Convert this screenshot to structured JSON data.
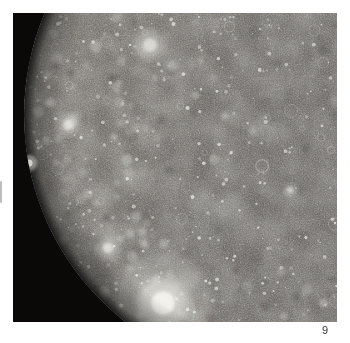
{
  "page": {
    "background": "#ffffff",
    "number": "9"
  },
  "photo": {
    "description": "Voyager photograph of Jupiter's moon Callisto: a heavily cratered gray-brown disk densely speckled with bright impact craters, its limb curving against black space on the left, with a large bright ray crater near the bottom center",
    "space_color": "#0a0908",
    "palette": {
      "surface_left": "#827e78",
      "surface_mid": "#787571",
      "surface_right": "#6e6b67",
      "crater_bright": "#f3f2ec",
      "shadow_dark": "#2e2c29",
      "limb_shadow": "#060605"
    },
    "disk": {
      "cx": 273,
      "cy": 102,
      "r": 262
    },
    "texture": {
      "seed": 9,
      "small_craters": 320,
      "ring_craters": 30,
      "medium_patches": 75,
      "large_patches": 16,
      "dark_patches": 45
    },
    "features": [
      {
        "name": "bright-ray-crater-bottom",
        "x": 150,
        "y": 290,
        "r": 26
      },
      {
        "name": "bright-patch-top",
        "x": 137,
        "y": 32,
        "r": 15
      },
      {
        "name": "limb-bright-spot-upper",
        "x": 16,
        "y": 150,
        "r": 8
      },
      {
        "name": "bright-patch-left",
        "x": 55,
        "y": 112,
        "r": 11
      },
      {
        "name": "bright-patch-lower-left",
        "x": 95,
        "y": 235,
        "r": 11
      },
      {
        "name": "bright-spot-right",
        "x": 277,
        "y": 177,
        "r": 6
      }
    ]
  }
}
